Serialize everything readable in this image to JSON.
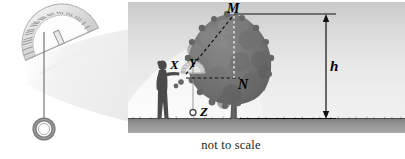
{
  "figure": {
    "caption": "not to scale",
    "colors": {
      "sky_top": "#cfcfcf",
      "sky_bottom": "#f2f2f2",
      "ground": "#8e8e8e",
      "tree": "#6f6f6f",
      "person": "#4a4a4a",
      "line": "#1a1a1a",
      "protractor_ghost": "#d8d8d8"
    }
  },
  "clinometer": {
    "name": "protractor-clinometer",
    "tick_count": 30,
    "plumb_line": "vertical string",
    "weight": "ring weight"
  },
  "scene": {
    "person": "observer silhouette",
    "tree": "broadleaf tree",
    "ground": "grass strip"
  },
  "labels": {
    "m": "M",
    "n": "N",
    "h": "h",
    "x": "X",
    "y": "Y",
    "z": "Z"
  },
  "lines": {
    "sight_line": "dashed line from Y to M",
    "horizontal_line": "dashed line from Y to N",
    "vertical_line": "dashed line from M to N",
    "dimension": "h height dimension with arrows"
  }
}
